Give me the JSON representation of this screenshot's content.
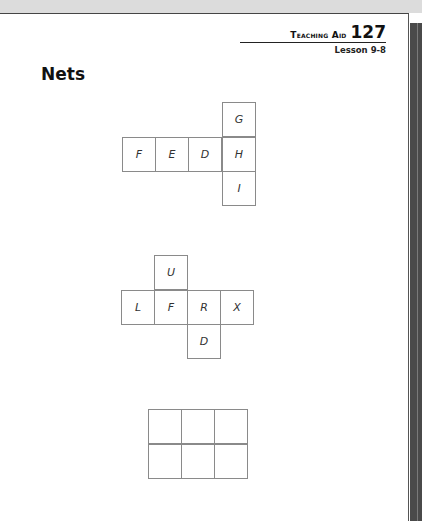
{
  "header": {
    "teaching_aid_label": "Teaching Aid",
    "teaching_aid_number": "127",
    "lesson": "Lesson 9-8"
  },
  "title": "Nets",
  "nets": [
    {
      "name": "net-1",
      "cells": [
        {
          "label": "G",
          "col": 3,
          "row": 0
        },
        {
          "label": "F",
          "col": 0,
          "row": 1
        },
        {
          "label": "E",
          "col": 1,
          "row": 1
        },
        {
          "label": "D",
          "col": 2,
          "row": 1
        },
        {
          "label": "H",
          "col": 3,
          "row": 1
        },
        {
          "label": "I",
          "col": 3,
          "row": 2
        }
      ]
    },
    {
      "name": "net-2",
      "cells": [
        {
          "label": "U",
          "col": 1,
          "row": 0
        },
        {
          "label": "L",
          "col": 0,
          "row": 1
        },
        {
          "label": "F",
          "col": 1,
          "row": 1
        },
        {
          "label": "R",
          "col": 2,
          "row": 1
        },
        {
          "label": "X",
          "col": 3,
          "row": 1
        },
        {
          "label": "D",
          "col": 2,
          "row": 2
        }
      ]
    },
    {
      "name": "net-3",
      "cells": [
        {
          "label": "",
          "col": 0,
          "row": 0
        },
        {
          "label": "",
          "col": 1,
          "row": 0
        },
        {
          "label": "",
          "col": 2,
          "row": 0
        },
        {
          "label": "",
          "col": 0,
          "row": 1
        },
        {
          "label": "",
          "col": 1,
          "row": 1
        },
        {
          "label": "",
          "col": 2,
          "row": 1
        }
      ]
    }
  ]
}
